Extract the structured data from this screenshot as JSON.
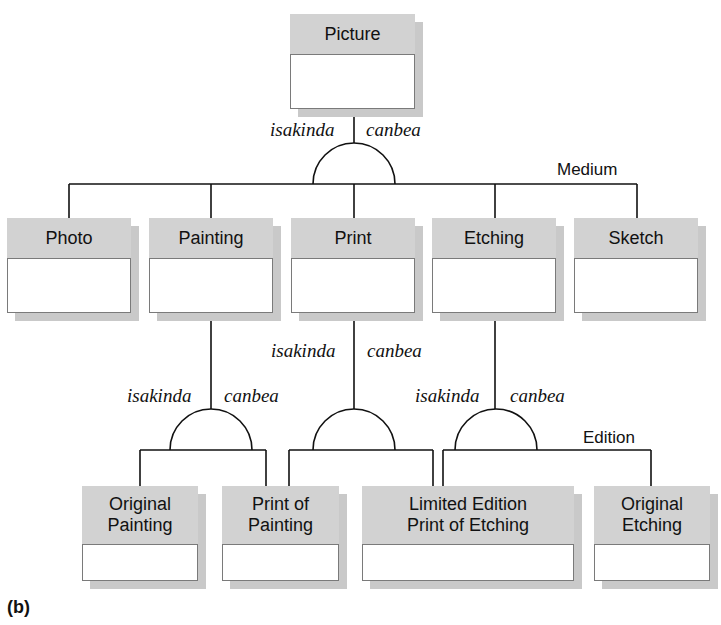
{
  "figure": {
    "caption": "(b)"
  },
  "nodes": {
    "picture": {
      "label": "Picture"
    },
    "photo": {
      "label": "Photo"
    },
    "painting": {
      "label": "Painting"
    },
    "print": {
      "label": "Print"
    },
    "etching": {
      "label": "Etching"
    },
    "sketch": {
      "label": "Sketch"
    },
    "original_painting": {
      "label": "Original\nPainting"
    },
    "print_of_painting": {
      "label": "Print of\nPainting"
    },
    "limited_edition_print_of_etching": {
      "label": "Limited Edition\nPrint of Etching"
    },
    "original_etching": {
      "label": "Original\nEtching"
    }
  },
  "relations": {
    "picture_split": {
      "left": "isakinda",
      "right": "canbea",
      "discriminator": "Medium"
    },
    "painting_split": {
      "left": "isakinda",
      "right": "canbea"
    },
    "print_split": {
      "left": "isakinda",
      "right": "canbea"
    },
    "etching_split": {
      "left": "isakinda",
      "right": "canbea",
      "discriminator": "Edition"
    }
  },
  "colors": {
    "header_fill": "#d2d2d2",
    "shadow": "#c9c9c9",
    "border": "#7a7a7a",
    "line": "#111111"
  }
}
